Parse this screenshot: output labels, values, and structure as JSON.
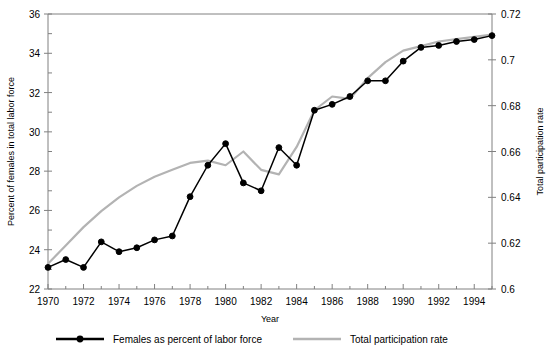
{
  "chart_data": {
    "type": "line",
    "title": "",
    "xlabel": "Year",
    "ylabel": "Percent of females in total labor force",
    "y2label": "Total participation rate",
    "x": [
      1970,
      1971,
      1972,
      1973,
      1974,
      1975,
      1976,
      1977,
      1978,
      1979,
      1980,
      1981,
      1982,
      1983,
      1984,
      1985,
      1986,
      1987,
      1988,
      1989,
      1990,
      1991,
      1992,
      1993,
      1994,
      1995
    ],
    "xlim": [
      1970,
      1995
    ],
    "ylim": [
      22,
      36
    ],
    "y2lim": [
      0.6,
      0.72
    ],
    "xticks": [
      1970,
      1972,
      1974,
      1976,
      1978,
      1980,
      1982,
      1984,
      1986,
      1988,
      1990,
      1992,
      1994
    ],
    "xticklabels": [
      "1970",
      "1972",
      "1974",
      "1976",
      "1978",
      "1980",
      "1982",
      "1984",
      "1986",
      "1988",
      "1990",
      "1992",
      "1994"
    ],
    "yticks": [
      22,
      24,
      26,
      28,
      30,
      32,
      34,
      36
    ],
    "yticklabels": [
      "22",
      "24",
      "26",
      "28",
      "30",
      "32",
      "34",
      "36"
    ],
    "y2ticks": [
      0.6,
      0.62,
      0.64,
      0.66,
      0.68,
      0.7,
      0.72
    ],
    "y2ticklabels": [
      "0.6",
      "0.62",
      "0.64",
      "0.66",
      "0.68",
      "0.7",
      "0.72"
    ],
    "minor_xticks_interval": 1,
    "grid": false,
    "legend_position": "below",
    "series": [
      {
        "name": "Females as percent of labor force",
        "axis": "left",
        "color": "#000000",
        "marker": "circle",
        "values": [
          23.1,
          23.5,
          23.1,
          24.4,
          23.9,
          24.1,
          24.5,
          24.7,
          26.7,
          28.3,
          29.4,
          27.4,
          27.0,
          29.2,
          28.3,
          31.1,
          31.4,
          31.8,
          32.6,
          32.6,
          33.6,
          34.3,
          34.4,
          34.6,
          34.7,
          34.9
        ]
      },
      {
        "name": "Total participation rate",
        "axis": "right",
        "color": "#b3b3b3",
        "marker": "none",
        "values": [
          0.611,
          0.619,
          0.627,
          0.634,
          0.64,
          0.645,
          0.649,
          0.652,
          0.655,
          0.656,
          0.654,
          0.66,
          0.652,
          0.65,
          0.662,
          0.678,
          0.684,
          0.683,
          0.692,
          0.699,
          0.704,
          0.706,
          0.708,
          0.709,
          0.71,
          0.711
        ]
      }
    ]
  },
  "legend": {
    "items": [
      {
        "label": "Females as percent of labor force",
        "color": "#000000",
        "marker": "circle"
      },
      {
        "label": "Total participation rate",
        "color": "#b3b3b3",
        "marker": "none"
      }
    ]
  },
  "colors": {
    "series_black": "#000000",
    "series_gray": "#b3b3b3",
    "axis": "#808080",
    "background": "#ffffff"
  }
}
